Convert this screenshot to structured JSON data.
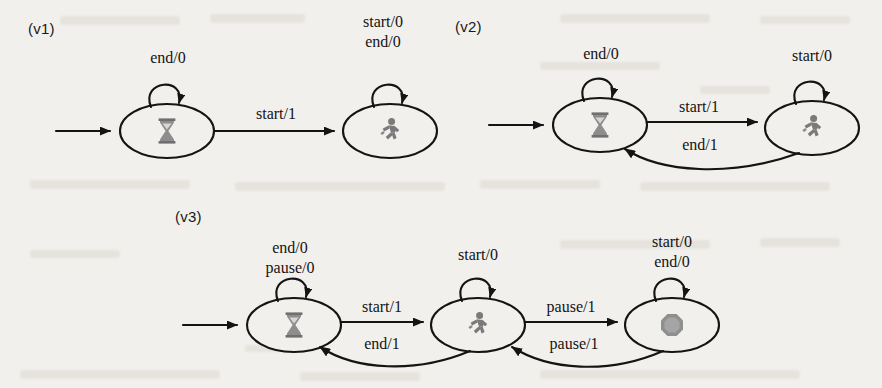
{
  "page": {
    "width": 882,
    "height": 388,
    "background_color": "#f2f0ec",
    "ink_color": "#141414"
  },
  "icons": {
    "idle": "hourglass-icon",
    "running": "running-person-icon",
    "paused": "filled-octagon-icon"
  },
  "diagrams": [
    {
      "id": "v1",
      "version_label": "(v1)",
      "states": [
        {
          "id": "idle",
          "icon": "hourglass-icon",
          "initial": true,
          "self_loop_labels": [
            "end/0"
          ]
        },
        {
          "id": "running",
          "icon": "running-person-icon",
          "initial": false,
          "self_loop_labels": [
            "start/0",
            "end/0"
          ]
        }
      ],
      "transitions": [
        {
          "from": "idle",
          "to": "running",
          "label": "start/1"
        }
      ]
    },
    {
      "id": "v2",
      "version_label": "(v2)",
      "states": [
        {
          "id": "idle",
          "icon": "hourglass-icon",
          "initial": true,
          "self_loop_labels": [
            "end/0"
          ]
        },
        {
          "id": "running",
          "icon": "running-person-icon",
          "initial": false,
          "self_loop_labels": [
            "start/0"
          ]
        }
      ],
      "transitions": [
        {
          "from": "idle",
          "to": "running",
          "label": "start/1"
        },
        {
          "from": "running",
          "to": "idle",
          "label": "end/1"
        }
      ]
    },
    {
      "id": "v3",
      "version_label": "(v3)",
      "states": [
        {
          "id": "idle",
          "icon": "hourglass-icon",
          "initial": true,
          "self_loop_labels": [
            "end/0",
            "pause/0"
          ]
        },
        {
          "id": "running",
          "icon": "running-person-icon",
          "initial": false,
          "self_loop_labels": [
            "start/0"
          ]
        },
        {
          "id": "paused",
          "icon": "filled-octagon-icon",
          "initial": false,
          "self_loop_labels": [
            "start/0",
            "end/0"
          ]
        }
      ],
      "transitions": [
        {
          "from": "idle",
          "to": "running",
          "label": "start/1"
        },
        {
          "from": "running",
          "to": "idle",
          "label": "end/1"
        },
        {
          "from": "running",
          "to": "paused",
          "label": "pause/1"
        },
        {
          "from": "paused",
          "to": "running",
          "label": "pause/1"
        }
      ]
    }
  ],
  "labels": {
    "v1_version": "(v1)",
    "v1_idle_loop": "end/0",
    "v1_running_loop_1": "start/0",
    "v1_running_loop_2": "end/0",
    "v1_start1": "start/1",
    "v2_version": "(v2)",
    "v2_idle_loop": "end/0",
    "v2_running_loop": "start/0",
    "v2_start1": "start/1",
    "v2_end1": "end/1",
    "v3_version": "(v3)",
    "v3_idle_loop_1": "end/0",
    "v3_idle_loop_2": "pause/0",
    "v3_running_loop": "start/0",
    "v3_paused_loop_1": "start/0",
    "v3_paused_loop_2": "end/0",
    "v3_start1": "start/1",
    "v3_end1": "end/1",
    "v3_pause1_fwd": "pause/1",
    "v3_pause1_back": "pause/1"
  }
}
